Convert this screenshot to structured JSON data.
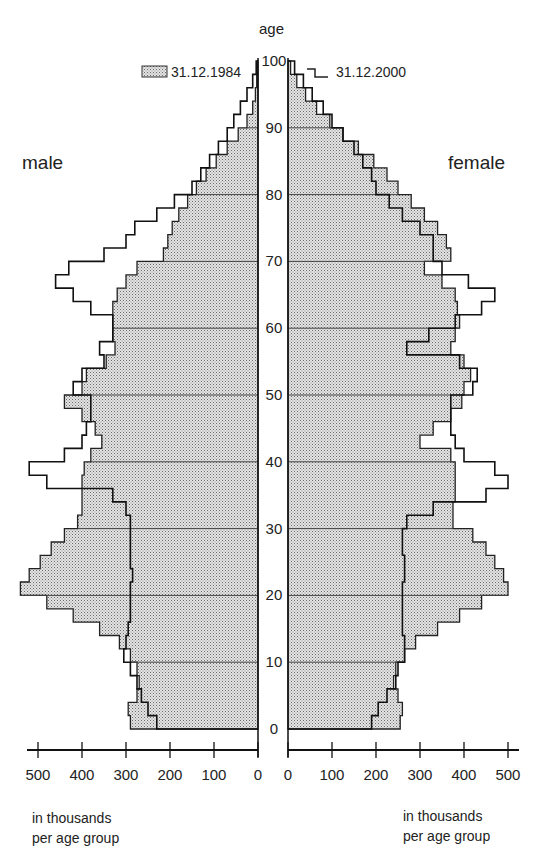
{
  "chart_data": {
    "type": "population-pyramid",
    "title": "",
    "axis_title_age": "age",
    "side_labels": {
      "left": "male",
      "right": "female"
    },
    "legend": [
      {
        "label": "31.12.1984",
        "style": "dotted-fill"
      },
      {
        "label": "31.12.2000",
        "style": "step-line"
      }
    ],
    "x_ticks_left": [
      "500",
      "400",
      "300",
      "200",
      "100",
      "0"
    ],
    "x_ticks_right": [
      "0",
      "100",
      "200",
      "300",
      "400",
      "500"
    ],
    "age_ticks": [
      "0",
      "10",
      "20",
      "30",
      "40",
      "50",
      "60",
      "70",
      "80",
      "90",
      "100"
    ],
    "unit_note_left": [
      "in thousands",
      "per age group"
    ],
    "unit_note_right": [
      "in thousands",
      "per age group"
    ],
    "xlim": [
      0,
      520
    ],
    "ylim": [
      0,
      100
    ],
    "ages": [
      0,
      2,
      4,
      6,
      8,
      10,
      12,
      14,
      16,
      18,
      20,
      22,
      24,
      26,
      28,
      30,
      32,
      34,
      36,
      38,
      40,
      42,
      44,
      46,
      48,
      50,
      52,
      54,
      56,
      58,
      60,
      62,
      64,
      66,
      68,
      70,
      72,
      74,
      76,
      78,
      80,
      82,
      84,
      86,
      88,
      90,
      92,
      94,
      96,
      98,
      100
    ],
    "series": [
      {
        "name": "male 31.12.1984",
        "values": [
          290,
          295,
          275,
          270,
          275,
          290,
          315,
          360,
          420,
          480,
          540,
          520,
          495,
          470,
          440,
          410,
          400,
          400,
          400,
          395,
          380,
          355,
          370,
          400,
          440,
          400,
          390,
          345,
          325,
          330,
          330,
          330,
          320,
          300,
          275,
          215,
          205,
          195,
          180,
          160,
          140,
          118,
          95,
          70,
          45,
          25,
          12,
          6,
          3,
          1,
          0
        ]
      },
      {
        "name": "male 31.12.2000",
        "values": [
          230,
          250,
          265,
          275,
          290,
          305,
          300,
          295,
          290,
          290,
          290,
          285,
          290,
          290,
          290,
          290,
          300,
          330,
          480,
          520,
          440,
          400,
          390,
          380,
          380,
          420,
          400,
          350,
          360,
          330,
          330,
          380,
          420,
          460,
          430,
          350,
          300,
          280,
          230,
          190,
          150,
          130,
          110,
          90,
          70,
          55,
          40,
          25,
          12,
          4,
          0
        ]
      },
      {
        "name": "female 31.12.1984",
        "values": [
          255,
          260,
          250,
          240,
          245,
          265,
          290,
          340,
          390,
          440,
          500,
          490,
          470,
          450,
          420,
          375,
          375,
          380,
          380,
          380,
          370,
          300,
          330,
          370,
          395,
          400,
          415,
          400,
          370,
          380,
          390,
          385,
          380,
          350,
          310,
          370,
          360,
          340,
          310,
          280,
          250,
          225,
          195,
          160,
          125,
          95,
          65,
          40,
          20,
          6,
          0
        ]
      },
      {
        "name": "female 31.12.2000",
        "values": [
          190,
          205,
          225,
          245,
          250,
          265,
          265,
          260,
          260,
          260,
          260,
          265,
          265,
          260,
          260,
          270,
          330,
          450,
          500,
          470,
          400,
          380,
          370,
          370,
          370,
          420,
          430,
          390,
          270,
          320,
          380,
          440,
          470,
          410,
          350,
          330,
          330,
          300,
          260,
          230,
          200,
          190,
          170,
          150,
          125,
          100,
          80,
          55,
          35,
          15,
          0
        ]
      }
    ]
  }
}
